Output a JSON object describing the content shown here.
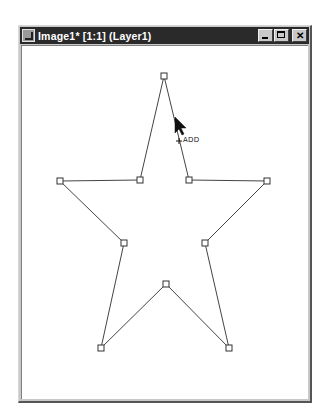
{
  "window": {
    "title": "Image1* [1:1] (Layer1)",
    "buttons": {
      "minimize": "minimize",
      "maximize": "maximize",
      "close": "✕"
    }
  },
  "canvas": {
    "shape": "star",
    "stroke_color": "#444444",
    "fill": "none",
    "anchor_points": [
      {
        "x": 164,
        "y": 76
      },
      {
        "x": 189,
        "y": 180
      },
      {
        "x": 267,
        "y": 181
      },
      {
        "x": 205,
        "y": 243
      },
      {
        "x": 229,
        "y": 348
      },
      {
        "x": 166,
        "y": 284
      },
      {
        "x": 101,
        "y": 348
      },
      {
        "x": 124,
        "y": 243
      },
      {
        "x": 60,
        "y": 181
      },
      {
        "x": 140,
        "y": 180
      }
    ]
  },
  "cursor": {
    "type": "arrow-add",
    "label": "ADD",
    "tip": {
      "x": 175,
      "y": 117
    }
  }
}
